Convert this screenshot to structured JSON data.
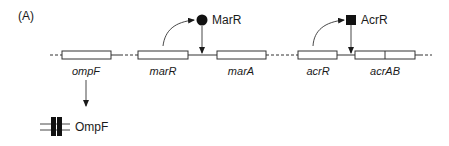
{
  "figure": {
    "panel_label": "(A)",
    "colors": {
      "line": "#333333",
      "fill_dark": "#111111",
      "background": "#ffffff"
    }
  },
  "genes": [
    {
      "id": "ompF",
      "label": "ompF"
    },
    {
      "id": "marR",
      "label": "marR"
    },
    {
      "id": "marA",
      "label": "marA"
    },
    {
      "id": "acrR",
      "label": "acrR"
    },
    {
      "id": "acrAB",
      "label": "acrAB"
    }
  ],
  "proteins": {
    "marR": {
      "label": "MarR",
      "shape": "circle"
    },
    "acrR": {
      "label": "AcrR",
      "shape": "square"
    },
    "ompF": {
      "label": "OmpF",
      "shape": "membrane-porin"
    }
  },
  "relationships": [
    {
      "from": "marR gene",
      "to": "MarR protein",
      "type": "expression"
    },
    {
      "from": "MarR protein",
      "to": "marR/marA promoter",
      "type": "repression"
    },
    {
      "from": "acrR gene",
      "to": "AcrR protein",
      "type": "expression"
    },
    {
      "from": "AcrR protein",
      "to": "acrAB promoter",
      "type": "repression"
    },
    {
      "from": "ompF gene",
      "to": "OmpF protein",
      "type": "expression"
    }
  ]
}
